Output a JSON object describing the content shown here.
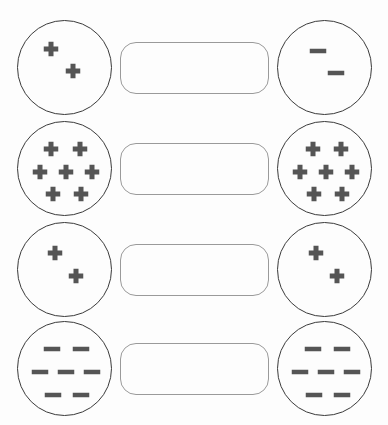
{
  "page": {
    "background_color": "#fdfdfd",
    "width": 388,
    "height": 425
  },
  "style": {
    "circle_stroke_color": "#3a3a3a",
    "circle_stroke_width": 1.6,
    "circle_fill": "#fdfdfd",
    "box_stroke_color": "#9a9a9a",
    "box_stroke_width": 1.4,
    "box_fill": "#fdfdfd",
    "box_corner_radius": 16,
    "symbol_color": "#555555",
    "plus_arm_length": 15,
    "plus_arm_thickness": 5,
    "minus_length": 17,
    "minus_thickness": 5
  },
  "geometry": {
    "circle_diameter": 95,
    "left_circle_x": 17,
    "right_circle_x": 277,
    "box_x": 120,
    "box_width": 149,
    "box_height": 52,
    "row_tops": [
      20,
      121,
      222,
      321
    ],
    "row_height": 100
  },
  "rows": [
    {
      "id": "row-1",
      "label": "pair-1",
      "answer_box": {
        "id": "answer-box-1",
        "value": "",
        "placeholder": ""
      },
      "left": {
        "id": "circle-1-left",
        "charge_type": "positive",
        "charge_symbol": "+",
        "charge_count": 2,
        "net_charge": "+2",
        "positions": [
          {
            "cx": 33,
            "cy": 28
          },
          {
            "cx": 55,
            "cy": 50
          }
        ]
      },
      "right": {
        "id": "circle-1-right",
        "charge_type": "negative",
        "charge_symbol": "−",
        "charge_count": 2,
        "net_charge": "-2",
        "positions": [
          {
            "cx": 40,
            "cy": 30
          },
          {
            "cx": 58,
            "cy": 52
          }
        ]
      }
    },
    {
      "id": "row-2",
      "label": "pair-2",
      "answer_box": {
        "id": "answer-box-2",
        "value": "",
        "placeholder": ""
      },
      "left": {
        "id": "circle-2-left",
        "charge_type": "positive",
        "charge_symbol": "+",
        "charge_count": 7,
        "net_charge": "+7",
        "positions": [
          {
            "cx": 33,
            "cy": 27
          },
          {
            "cx": 62,
            "cy": 27
          },
          {
            "cx": 22,
            "cy": 50
          },
          {
            "cx": 48,
            "cy": 50
          },
          {
            "cx": 74,
            "cy": 50
          },
          {
            "cx": 35,
            "cy": 72
          },
          {
            "cx": 63,
            "cy": 72
          }
        ]
      },
      "right": {
        "id": "circle-2-right",
        "charge_type": "positive",
        "charge_symbol": "+",
        "charge_count": 7,
        "net_charge": "+7",
        "positions": [
          {
            "cx": 35,
            "cy": 27
          },
          {
            "cx": 63,
            "cy": 27
          },
          {
            "cx": 22,
            "cy": 50
          },
          {
            "cx": 48,
            "cy": 50
          },
          {
            "cx": 74,
            "cy": 50
          },
          {
            "cx": 36,
            "cy": 72
          },
          {
            "cx": 64,
            "cy": 72
          }
        ]
      }
    },
    {
      "id": "row-3",
      "label": "pair-3",
      "answer_box": {
        "id": "answer-box-3",
        "value": "",
        "placeholder": ""
      },
      "left": {
        "id": "circle-3-left",
        "charge_type": "positive",
        "charge_symbol": "+",
        "charge_count": 2,
        "net_charge": "+2",
        "positions": [
          {
            "cx": 37,
            "cy": 30
          },
          {
            "cx": 58,
            "cy": 53
          }
        ]
      },
      "right": {
        "id": "circle-3-right",
        "charge_type": "positive",
        "charge_symbol": "+",
        "charge_count": 2,
        "net_charge": "+2",
        "positions": [
          {
            "cx": 38,
            "cy": 30
          },
          {
            "cx": 59,
            "cy": 53
          }
        ]
      }
    },
    {
      "id": "row-4",
      "label": "pair-4",
      "answer_box": {
        "id": "answer-box-4",
        "value": "",
        "placeholder": ""
      },
      "left": {
        "id": "circle-4-left",
        "charge_type": "negative",
        "charge_symbol": "−",
        "charge_count": 7,
        "net_charge": "-7",
        "positions": [
          {
            "cx": 34,
            "cy": 27
          },
          {
            "cx": 63,
            "cy": 27
          },
          {
            "cx": 22,
            "cy": 50
          },
          {
            "cx": 48,
            "cy": 50
          },
          {
            "cx": 74,
            "cy": 50
          },
          {
            "cx": 35,
            "cy": 73
          },
          {
            "cx": 63,
            "cy": 73
          }
        ]
      },
      "right": {
        "id": "circle-4-right",
        "charge_type": "negative",
        "charge_symbol": "−",
        "charge_count": 7,
        "net_charge": "-7",
        "positions": [
          {
            "cx": 35,
            "cy": 27
          },
          {
            "cx": 64,
            "cy": 27
          },
          {
            "cx": 22,
            "cy": 50
          },
          {
            "cx": 48,
            "cy": 50
          },
          {
            "cx": 74,
            "cy": 50
          },
          {
            "cx": 36,
            "cy": 73
          },
          {
            "cx": 64,
            "cy": 73
          }
        ]
      }
    }
  ]
}
